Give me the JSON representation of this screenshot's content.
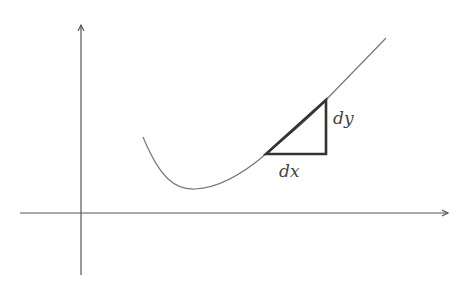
{
  "diagram": {
    "type": "derivative-slope-triangle",
    "axes": {
      "x_axis": {
        "has_arrow": true
      },
      "y_axis": {
        "has_arrow": true
      }
    },
    "curve": {
      "description": "smooth convex curve with a minimum, increasing to the right"
    },
    "triangle": {
      "horizontal_label": "dx",
      "vertical_label": "dy"
    },
    "colors": {
      "axis": "#555555",
      "curve": "#777777",
      "triangle": "#333333",
      "label": "#444444",
      "background": "#ffffff"
    }
  }
}
